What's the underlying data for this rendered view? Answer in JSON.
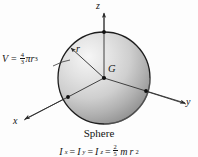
{
  "figure": {
    "title": "Sphere",
    "caption": "Sphere",
    "center_label": "G",
    "radius_label": "r",
    "axes": {
      "z": "z",
      "y": "y",
      "x": "x"
    },
    "volume": {
      "symbol": "V",
      "equals": "=",
      "numerator": "4",
      "denominator": "3",
      "pi": "π",
      "radius_symbol": "r",
      "exponent": "3",
      "full_text": "V = 4/3 πr³"
    },
    "inertia": {
      "symbol_1": "I",
      "sub_1": "x",
      "eq_1": "=",
      "symbol_2": "I",
      "sub_2": "y",
      "eq_2": "=",
      "symbol_3": "I",
      "sub_3": "z",
      "eq_3": "=",
      "numerator": "2",
      "denominator": "5",
      "mass_symbol": "m",
      "radius_symbol": "r",
      "exponent": "2",
      "full_text": "Iₓ = Iᵧ = Iᶻ = 2/5 mr²"
    }
  },
  "colors": {
    "outline": "#1d1d1d",
    "sphere_light": "#f2f2f2",
    "sphere_mid": "#c9c9c9",
    "sphere_dark": "#8e8e8e",
    "axis": "#3a3a3a",
    "background": "#fdfdfd",
    "text": "#141414"
  }
}
